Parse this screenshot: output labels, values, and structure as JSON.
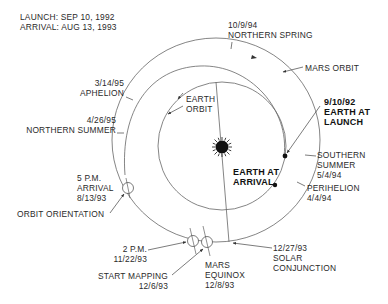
{
  "header": {
    "launch": "LAUNCH: SEP 10, 1992",
    "arrival": "ARRIVAL: AUG 13, 1993"
  },
  "colors": {
    "line": "#555555",
    "text": "#2a2a2a",
    "sun": "#111111",
    "background": "#ffffff"
  },
  "labels": {
    "northern_spring": {
      "date": "10/9/94",
      "text": "NORTHERN SPRING"
    },
    "mars_orbit": "MARS ORBIT",
    "earth_launch": {
      "date": "9/10/92",
      "line1": "EARTH AT",
      "line2": "LAUNCH"
    },
    "southern_summer": {
      "line1": "SOUTHERN",
      "line2": "SUMMER",
      "date": "5/4/94"
    },
    "perihelion": {
      "text": "PERIHELION",
      "date": "4/4/94"
    },
    "aphelion": {
      "date": "3/14/95",
      "text": "APHELION"
    },
    "northern_summer": {
      "date": "4/26/95",
      "text": "NORTHERN SUMMER"
    },
    "earth_orbit": {
      "line1": "EARTH",
      "line2": "ORBIT"
    },
    "earth_arrival": {
      "line1": "EARTH AT",
      "line2": "ARRIVAL"
    },
    "arrival": {
      "time": "5 P.M.",
      "text": "ARRIVAL",
      "date": "8/13/93"
    },
    "orbit_orientation": "ORBIT ORIENTATION",
    "two_pm": {
      "time": "2 P.M.",
      "date": "11/22/93"
    },
    "start_mapping": {
      "text": "START MAPPING",
      "date": "12/6/93"
    },
    "mars_equinox": {
      "line1": "MARS",
      "line2": "EQUINOX",
      "date": "12/8/93"
    },
    "solar_conjunction": {
      "date": "12/27/93",
      "line1": "SOLAR",
      "line2": "CONJUNCTION"
    }
  },
  "icons": {
    "sun": "sun-icon",
    "planet_marker": "filled-dot",
    "spacecraft_position": "crosshair-circle"
  }
}
